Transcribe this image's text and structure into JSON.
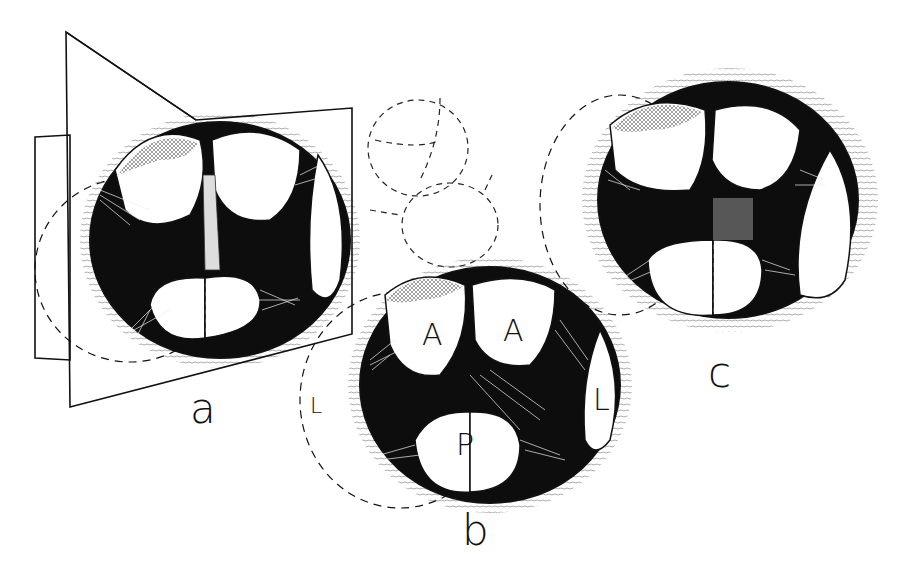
{
  "figure": {
    "panels": [
      {
        "id": "a",
        "label": "a",
        "note": "orifice shown with section plane"
      },
      {
        "id": "b",
        "label": "b",
        "cusp_labels": [
          "A",
          "A",
          "L",
          "P",
          "L"
        ]
      },
      {
        "id": "c",
        "label": "c"
      }
    ],
    "colors": {
      "ink": "#111111",
      "background": "#ffffff"
    }
  }
}
